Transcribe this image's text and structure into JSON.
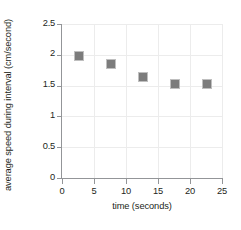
{
  "chart_data": {
    "type": "scatter",
    "title": "",
    "xlabel": "time (seconds)",
    "ylabel": "average speed during interval (cm/second)",
    "x": [
      2.5,
      7.5,
      12.5,
      17.5,
      22.5
    ],
    "values": [
      2.0,
      1.86,
      1.66,
      1.55,
      1.55
    ],
    "xlim": [
      0,
      25
    ],
    "ylim": [
      0,
      2.5
    ],
    "xticks": [
      "0",
      "5",
      "10",
      "15",
      "20",
      "25"
    ],
    "xtick_values": [
      0,
      5,
      10,
      15,
      20,
      25
    ],
    "yticks": [
      "0",
      "0.5",
      "1",
      "1.5",
      "2",
      "2.5"
    ],
    "ytick_values": [
      0,
      0.5,
      1,
      1.5,
      2,
      2.5
    ],
    "grid": true,
    "legend": "none",
    "marker": "square",
    "marker_color": "#7c7c7c",
    "gridline_color": "#ececec",
    "axis_color": "#939598",
    "background_color": "#ffffff"
  }
}
